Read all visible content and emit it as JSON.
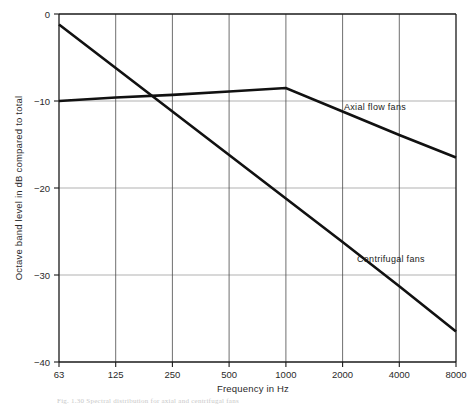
{
  "figure": {
    "caption": "Fig. 1.30 Spectral distribution for axial and centrifugal fans"
  },
  "chart_data": {
    "type": "line",
    "title": "",
    "xlabel": "Frequency in Hz",
    "ylabel": "Octave band level in dB compared to total",
    "x": [
      63,
      125,
      250,
      500,
      1000,
      2000,
      4000,
      8000
    ],
    "categories": [
      "63",
      "125",
      "250",
      "500",
      "1000",
      "2000",
      "4000",
      "8000"
    ],
    "xscale": "octave-band (evenly spaced)",
    "ylim": [
      -40,
      0
    ],
    "yticks": [
      0,
      -10,
      -20,
      -30,
      -40
    ],
    "yticklabels": [
      "0",
      "−10",
      "−20",
      "−30",
      "−40"
    ],
    "grid": "both",
    "legend": "inline-annotations",
    "series": [
      {
        "name": "Axial flow fans",
        "values": [
          -10.0,
          -9.6,
          -9.3,
          -8.9,
          -8.5,
          -11.2,
          -13.9,
          -16.5
        ],
        "label_text": "Axial flow fans"
      },
      {
        "name": "Centrifugal fans",
        "values": [
          -1.2,
          -6.2,
          -11.2,
          -16.2,
          -21.2,
          -26.2,
          -31.3,
          -36.5
        ],
        "label_text": "Centrifugal fans"
      }
    ]
  }
}
